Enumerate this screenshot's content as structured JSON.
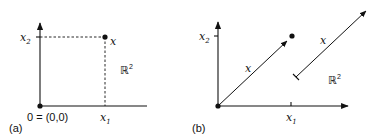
{
  "figure": {
    "panel_a": {
      "caption": "(a)",
      "origin_label": "0 = (0,0)",
      "x1_label": "x",
      "x1_sub": "1",
      "x2_label": "x",
      "x2_sub": "2",
      "point_label": "x",
      "space_label": "ℝ",
      "space_sup": "2",
      "description": "Point x in the plane R^2 with coordinates (x1, x2), dashed projections onto axes"
    },
    "panel_b": {
      "caption": "(b)",
      "x1_label": "x",
      "x1_sub": "1",
      "x2_label": "x",
      "x2_sub": "2",
      "vector_label_origin": "x",
      "vector_label_free": "x",
      "space_label": "ℝ",
      "space_sup": "2",
      "description": "Vector x drawn as arrow from origin to point, and the same vector translated elsewhere in R^2"
    }
  }
}
